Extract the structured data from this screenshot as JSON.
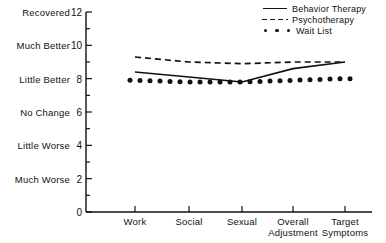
{
  "chart_data": {
    "type": "line",
    "title": "",
    "xlabel": "",
    "ylabel": "",
    "ylim": [
      0,
      12
    ],
    "yticks": [
      0,
      2,
      4,
      6,
      8,
      10,
      12
    ],
    "ytick_labels": [
      "0",
      "2",
      "4",
      "6",
      "8",
      "10",
      "12"
    ],
    "y_value_labels": [
      {
        "value": 12,
        "label": "Recovered"
      },
      {
        "value": 10,
        "label": "Much Better"
      },
      {
        "value": 8,
        "label": "Little Better"
      },
      {
        "value": 6,
        "label": "No Change"
      },
      {
        "value": 4,
        "label": "Little Worse"
      },
      {
        "value": 2,
        "label": "Much Worse"
      }
    ],
    "categories": [
      "Work",
      "Social",
      "Sexual",
      "Overall Adjustment",
      "Target Symptoms"
    ],
    "category_lines": [
      [
        "Work"
      ],
      [
        "Social"
      ],
      [
        "Sexual"
      ],
      [
        "Overall",
        "Adjustment"
      ],
      [
        "Target",
        "Symptoms"
      ]
    ],
    "grid": false,
    "legend_position": "top-right",
    "series": [
      {
        "name": "Behavior Therapy",
        "style": "solid",
        "values": [
          8.4,
          8.1,
          7.8,
          8.6,
          9.0
        ]
      },
      {
        "name": "Psychotherapy",
        "style": "dashed",
        "values": [
          9.3,
          9.0,
          8.9,
          9.0,
          9.0
        ]
      },
      {
        "name": "Wait List",
        "style": "dotted",
        "values": [
          7.9,
          7.8,
          7.8,
          7.9,
          8.0
        ]
      }
    ]
  },
  "legend": {
    "items": [
      {
        "label": "Behavior Therapy",
        "key": "solid-line-key"
      },
      {
        "label": "Psychotherapy",
        "key": "dashed-line-key"
      },
      {
        "label": "Wait List",
        "key": "dotted-line-key"
      }
    ]
  },
  "colors": {
    "ink": "#111111",
    "background": "#ffffff"
  }
}
